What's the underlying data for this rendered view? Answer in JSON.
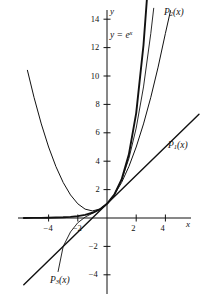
{
  "figure": {
    "kind": "math-plot",
    "background": "#ffffff",
    "ink": "#111111"
  },
  "axes": {
    "x_axis_name": "x",
    "y_axis_name": "y",
    "x_ticks": [
      {
        "value": -4,
        "label": "−4"
      },
      {
        "value": -2,
        "label": "−2"
      },
      {
        "value": 2,
        "label": "2"
      },
      {
        "value": 4,
        "label": "4"
      }
    ],
    "y_ticks": [
      {
        "value": 14,
        "label": "14"
      },
      {
        "value": 12,
        "label": "12"
      },
      {
        "value": 10,
        "label": "10"
      },
      {
        "value": 8,
        "label": "8"
      },
      {
        "value": 6,
        "label": "6"
      },
      {
        "value": 4,
        "label": "4"
      },
      {
        "value": 2,
        "label": "2"
      },
      {
        "value": -2,
        "label": "−2"
      },
      {
        "value": -4,
        "label": "−4"
      }
    ]
  },
  "annotations": {
    "exp_label": {
      "text_prefix": "y = e",
      "text_sup": "x"
    },
    "p1_label": {
      "base": "P",
      "sub": "1",
      "arg": "(x)"
    },
    "p2_label": {
      "base": "P",
      "sub": "2",
      "arg": "(x)"
    },
    "p3_label": {
      "base": "P",
      "sub": "3",
      "arg": "(x)"
    }
  },
  "chart_data": {
    "type": "line",
    "title": "",
    "xlabel": "x",
    "ylabel": "y",
    "xlim": [
      -5.7,
      6.5
    ],
    "ylim": [
      -5.7,
      15.5
    ],
    "grid": false,
    "legend": "inline-curve-labels",
    "series": [
      {
        "name": "y = e^x",
        "formula": "e^x",
        "label": "y = eˣ",
        "stroke_width": 1.9,
        "color": "#111111",
        "x": [
          -5.7,
          -5,
          -4.5,
          -4,
          -3.5,
          -3,
          -2.5,
          -2,
          -1.5,
          -1,
          -0.5,
          0,
          0.5,
          1,
          1.5,
          2,
          2.5,
          2.74
        ],
        "y": [
          0.0033,
          0.0067,
          0.0111,
          0.0183,
          0.0302,
          0.0498,
          0.0821,
          0.1353,
          0.2231,
          0.3679,
          0.6065,
          1.0,
          1.6487,
          2.7183,
          4.4817,
          7.3891,
          12.1825,
          15.5
        ]
      },
      {
        "name": "P1(x)",
        "formula": "1 + x",
        "label": "P₁(x)",
        "stroke_width": 1.4,
        "color": "#111111",
        "x": [
          -5.7,
          6.3
        ],
        "y": [
          -4.7,
          7.3
        ]
      },
      {
        "name": "P2(x)",
        "formula": "1 + x + x^2/2",
        "label": "P₂(x)",
        "stroke_width": 1.0,
        "color": "#111111",
        "x": [
          -5.45,
          -5,
          -4.5,
          -4,
          -3.5,
          -3,
          -2.5,
          -2,
          -1.5,
          -1,
          -0.5,
          0,
          0.5,
          1,
          1.5,
          2,
          2.5,
          3,
          3.5,
          4,
          4.35
        ],
        "y": [
          10.4,
          8.5,
          6.625,
          5.0,
          3.625,
          2.5,
          1.625,
          1.0,
          0.625,
          0.5,
          0.625,
          1.0,
          1.625,
          2.5,
          3.625,
          5.0,
          6.625,
          8.5,
          10.625,
          13.0,
          14.6
        ]
      },
      {
        "name": "P3(x)",
        "formula": "1 + x + x^2/2 + x^3/6",
        "label": "P₃(x)",
        "stroke_width": 0.9,
        "color": "#111111",
        "x": [
          -3.35,
          -3,
          -2.5,
          -2,
          -1.5,
          -1,
          -0.5,
          0,
          0.5,
          1,
          1.5,
          2,
          2.5,
          3,
          3.2
        ],
        "y": [
          -3.77,
          -2.0,
          -0.98,
          -0.333,
          0.0625,
          0.3333,
          0.6042,
          1.0,
          1.6458,
          2.6667,
          4.1875,
          6.3333,
          9.2292,
          13.0,
          14.77
        ]
      }
    ]
  }
}
